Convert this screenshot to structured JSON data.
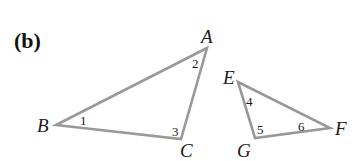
{
  "panel_label": "(b)",
  "colors": {
    "stroke": "#999999",
    "text": "#1a1a1a"
  },
  "triangles": [
    {
      "name": "ABC",
      "vertices": {
        "A": {
          "label": "A",
          "x": 207,
          "y": 48
        },
        "B": {
          "label": "B",
          "x": 56,
          "y": 125
        },
        "C": {
          "label": "C",
          "x": 181,
          "y": 139
        }
      },
      "angles": [
        {
          "id": "1",
          "label": "1",
          "at": "B"
        },
        {
          "id": "2",
          "label": "2",
          "at": "A"
        },
        {
          "id": "3",
          "label": "3",
          "at": "C"
        }
      ]
    },
    {
      "name": "EFG",
      "vertices": {
        "E": {
          "label": "E",
          "x": 238,
          "y": 82
        },
        "F": {
          "label": "F",
          "x": 330,
          "y": 128
        },
        "G": {
          "label": "G",
          "x": 255,
          "y": 138
        }
      },
      "angles": [
        {
          "id": "4",
          "label": "4",
          "at": "E"
        },
        {
          "id": "5",
          "label": "5",
          "at": "G"
        },
        {
          "id": "6",
          "label": "6",
          "at": "F"
        }
      ]
    }
  ]
}
